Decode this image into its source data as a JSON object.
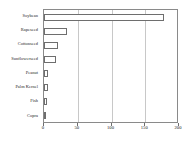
{
  "chart_data": {
    "type": "bar",
    "orientation": "horizontal",
    "title": "",
    "subtitle": "",
    "xlabel": "",
    "ylabel": "",
    "categories": [
      "Soybean",
      "Rapeseed",
      "Cottonseed",
      "Sunflowerseed",
      "Peanut",
      "Palm Kernel",
      "Fish",
      "Copra"
    ],
    "values": [
      179,
      34,
      22,
      19,
      7,
      7,
      5,
      3
    ],
    "xlim": [
      0,
      200
    ],
    "xticks": [
      0,
      50,
      100,
      150,
      200
    ],
    "xtick_labels": [
      "0",
      "50",
      "100",
      "150",
      "200"
    ],
    "grid": "vertical",
    "legend": null,
    "bar_fill_color": "#ffffff",
    "bar_border_color": "#6e6e6e",
    "gridline_color": "#c8c8c8",
    "axis_color": "#8a8a8a",
    "background_color": "#ffffff"
  }
}
